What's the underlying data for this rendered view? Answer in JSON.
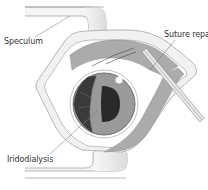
{
  "diagram": {
    "labels": {
      "speculum": "Speculum",
      "suture_repair": "Suture repair",
      "iridodialysis": "Iridodialysis"
    },
    "colors": {
      "background": "#ffffff",
      "outline": "#8a8a8a",
      "speculum_fill": "#efefef",
      "conjunctiva_fill": "#ababab",
      "sclera_fill": "#ffffff",
      "iris_fill": "#9a9a9a",
      "pupil_fill": "#2a2a2a",
      "iridodialysis_fill": "#3a3a3a",
      "label_text": "#333333",
      "leader_line": "#707070"
    }
  }
}
